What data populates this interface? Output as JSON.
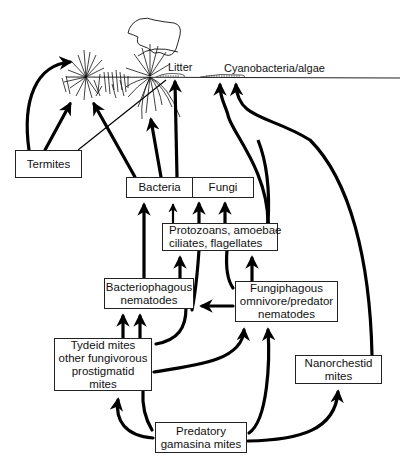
{
  "labels": {
    "litter": "Litter",
    "cyanobacteria": "Cyanobacteria/algae"
  },
  "nodes": {
    "termites": [
      "Termites"
    ],
    "bacteria": [
      "Bacteria"
    ],
    "fungi": [
      "Fungi"
    ],
    "protozoans": [
      "Protozoans, amoebae",
      "ciliates, flagellates"
    ],
    "bacteriophagous": [
      "Bacteriophagous",
      "nematodes"
    ],
    "fungiphagous": [
      "Fungiphagous",
      "omnivore/predator",
      "nematodes"
    ],
    "tydeid": [
      "Tydeid mites",
      "other fungivorous",
      "prostigmatid",
      "mites"
    ],
    "nanorchestid": [
      "Nanorchestid",
      "mites"
    ],
    "predatory": [
      "Predatory",
      "gamasina mites"
    ]
  },
  "edges": [
    {
      "from": "termites",
      "to": "plant-left"
    },
    {
      "from": "termites",
      "to": "grass-tuft"
    },
    {
      "from": "termites",
      "to": "litter",
      "style": "thin line"
    },
    {
      "from": "bacteria",
      "to": "grass-tuft"
    },
    {
      "from": "bacteria",
      "to": "plant-roots"
    },
    {
      "from": "fungi",
      "to": "litter"
    },
    {
      "from": "protozoans",
      "to": "bacteria"
    },
    {
      "from": "protozoans",
      "to": "fungi"
    },
    {
      "from": "bacteriophagous",
      "to": "bacteria"
    },
    {
      "from": "bacteriophagous",
      "to": "protozoans"
    },
    {
      "from": "bacteriophagous",
      "to": "fungi"
    },
    {
      "from": "fungiphagous",
      "to": "protozoans"
    },
    {
      "from": "fungiphagous",
      "to": "fungi"
    },
    {
      "from": "fungiphagous",
      "to": "bacteriophagous"
    },
    {
      "from": "fungiphagous",
      "to": "cyanobacteria"
    },
    {
      "from": "tydeid",
      "to": "bacteriophagous"
    },
    {
      "from": "tydeid",
      "to": "fungiphagous"
    },
    {
      "from": "tydeid",
      "to": "bacteriophagous",
      "style": "curve"
    },
    {
      "from": "predatory",
      "to": "tydeid"
    },
    {
      "from": "predatory",
      "to": "fungiphagous"
    },
    {
      "from": "predatory",
      "to": "nanorchestid"
    },
    {
      "from": "nanorchestid",
      "to": "cyanobacteria"
    }
  ]
}
